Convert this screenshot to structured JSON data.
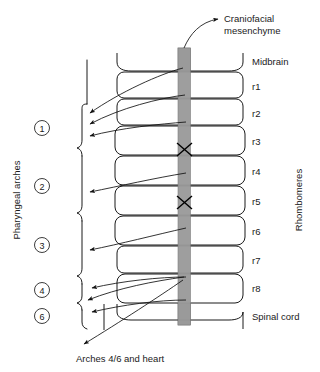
{
  "figure": {
    "background_color": "#ffffff",
    "stroke_color": "#000000",
    "bar_color": "#9a9a9a",
    "width": 320,
    "height": 372
  },
  "labels": {
    "craniofacial": "Craniofacial",
    "mesenchyme": "mesenchyme",
    "midbrain": "Midbrain",
    "spinal_cord": "Spinal cord",
    "rhombomeres_axis": "Rhombomeres",
    "pharyngeal_axis": "Pharyngeal arches",
    "bottom_caption": "Arches 4/6 and heart"
  },
  "rhombomeres": [
    {
      "id": "r1",
      "label": "r1"
    },
    {
      "id": "r2",
      "label": "r2"
    },
    {
      "id": "r3",
      "label": "r3"
    },
    {
      "id": "r4",
      "label": "r4"
    },
    {
      "id": "r5",
      "label": "r5"
    },
    {
      "id": "r6",
      "label": "r6"
    },
    {
      "id": "r7",
      "label": "r7"
    },
    {
      "id": "r8",
      "label": "r8"
    }
  ],
  "arches": [
    {
      "id": "arch-1",
      "label": "1"
    },
    {
      "id": "arch-2",
      "label": "2"
    },
    {
      "id": "arch-3",
      "label": "3"
    },
    {
      "id": "arch-4",
      "label": "4"
    },
    {
      "id": "arch-6",
      "label": "6"
    }
  ],
  "crest_death_markers": [
    {
      "at": "r3",
      "symbol": "X"
    },
    {
      "at": "r5",
      "symbol": "X"
    }
  ]
}
